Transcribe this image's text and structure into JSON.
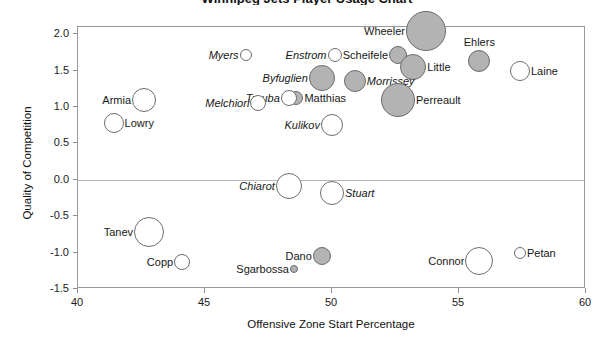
{
  "chart_data": {
    "type": "scatter",
    "title": "Winnipeg Jets Player Usage Chart",
    "xlabel": "Offensive Zone Start Percentage",
    "ylabel": "Quality of Competition",
    "xlim": [
      40,
      60
    ],
    "ylim": [
      -1.5,
      2.1
    ],
    "xticks": [
      40,
      45,
      50,
      55,
      60
    ],
    "yticks": [
      2.0,
      1.5,
      1.0,
      0.5,
      0.0,
      -0.5,
      -1.0,
      -1.5
    ],
    "ytick_labels": [
      "2.0",
      "1.5",
      "1.0",
      "0.5",
      "0.0",
      "-0.5",
      "-1.0",
      "-1.5"
    ],
    "xtick_labels": [
      "40",
      "45",
      "50",
      "55",
      "60"
    ],
    "grid": false,
    "reference_line_y": 0.0,
    "legend": "none",
    "size_encodes": "ice time / usage",
    "color_encodes": "positive (gray fill) vs negative (white fill) relative corsi",
    "points": [
      {
        "name": "Wheeler",
        "x": 53.7,
        "y": 2.04,
        "r": 20,
        "filled": true,
        "label_side": "left",
        "italic": false
      },
      {
        "name": "Ehlers",
        "x": 55.8,
        "y": 1.63,
        "r": 11,
        "filled": true,
        "label_side": "top",
        "italic": false
      },
      {
        "name": "Scheifele",
        "x": 52.6,
        "y": 1.72,
        "r": 9,
        "filled": true,
        "label_side": "left",
        "italic": false
      },
      {
        "name": "Little",
        "x": 53.2,
        "y": 1.55,
        "r": 13,
        "filled": true,
        "label_side": "right",
        "italic": false
      },
      {
        "name": "Laine",
        "x": 57.4,
        "y": 1.5,
        "r": 10,
        "filled": false,
        "label_side": "right",
        "italic": false
      },
      {
        "name": "Myers",
        "x": 46.6,
        "y": 1.72,
        "r": 6,
        "filled": false,
        "label_side": "left",
        "italic": true
      },
      {
        "name": "Enstrom",
        "x": 50.1,
        "y": 1.72,
        "r": 7,
        "filled": false,
        "label_side": "left",
        "italic": true
      },
      {
        "name": "Byfuglien",
        "x": 49.6,
        "y": 1.4,
        "r": 13,
        "filled": true,
        "label_side": "left",
        "italic": true
      },
      {
        "name": "Morrissey",
        "x": 50.9,
        "y": 1.36,
        "r": 11,
        "filled": true,
        "label_side": "right",
        "italic": true
      },
      {
        "name": "Perreault",
        "x": 52.6,
        "y": 1.1,
        "r": 17,
        "filled": true,
        "label_side": "right",
        "italic": false
      },
      {
        "name": "Matthias",
        "x": 48.6,
        "y": 1.12,
        "r": 7,
        "filled": true,
        "label_side": "right",
        "italic": false
      },
      {
        "name": "Trouba",
        "x": 48.3,
        "y": 1.12,
        "r": 8,
        "filled": false,
        "label_side": "left",
        "italic": true
      },
      {
        "name": "Melchiori",
        "x": 47.1,
        "y": 1.05,
        "r": 8,
        "filled": false,
        "label_side": "left",
        "italic": true
      },
      {
        "name": "Armia",
        "x": 42.6,
        "y": 1.1,
        "r": 12,
        "filled": false,
        "label_side": "left",
        "italic": false
      },
      {
        "name": "Lowry",
        "x": 41.4,
        "y": 0.78,
        "r": 10,
        "filled": false,
        "label_side": "right",
        "italic": false
      },
      {
        "name": "Kulikov",
        "x": 50.0,
        "y": 0.75,
        "r": 11,
        "filled": false,
        "label_side": "left",
        "italic": true
      },
      {
        "name": "Chiarot",
        "x": 48.3,
        "y": -0.08,
        "r": 13,
        "filled": false,
        "label_side": "left",
        "italic": true
      },
      {
        "name": "Stuart",
        "x": 50.0,
        "y": -0.18,
        "r": 12,
        "filled": false,
        "label_side": "right",
        "italic": true
      },
      {
        "name": "Tanev",
        "x": 42.8,
        "y": -0.72,
        "r": 15,
        "filled": false,
        "label_side": "left",
        "italic": false
      },
      {
        "name": "Copp",
        "x": 44.1,
        "y": -1.13,
        "r": 8,
        "filled": false,
        "label_side": "left",
        "italic": false
      },
      {
        "name": "Dano",
        "x": 49.6,
        "y": -1.05,
        "r": 9,
        "filled": true,
        "label_side": "left",
        "italic": false
      },
      {
        "name": "Sgarbossa",
        "x": 48.5,
        "y": -1.22,
        "r": 4,
        "filled": true,
        "label_side": "left",
        "italic": false
      },
      {
        "name": "Connor",
        "x": 55.8,
        "y": -1.12,
        "r": 14,
        "filled": false,
        "label_side": "left",
        "italic": false
      },
      {
        "name": "Petan",
        "x": 57.4,
        "y": -1.0,
        "r": 6,
        "filled": false,
        "label_side": "right",
        "italic": false
      }
    ]
  },
  "colors": {
    "bubble_fill_positive": "#b3b3b3",
    "bubble_fill_negative": "#ffffff",
    "bubble_stroke": "#6d6d6d",
    "frame": "#9a9a9a",
    "reference_line": "#b9b9b9",
    "text": "#1a1a1a"
  }
}
